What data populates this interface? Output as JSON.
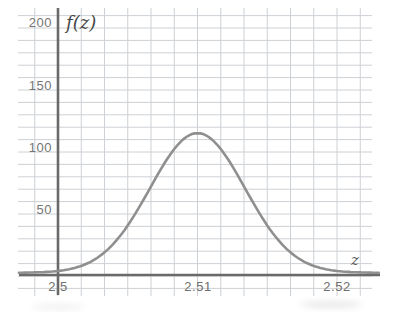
{
  "chart_data": {
    "type": "line",
    "title": "",
    "xlabel": "z",
    "ylabel": "f(z)",
    "x_ticks": [
      2.5,
      2.51,
      2.52
    ],
    "x_tick_labels": [
      "2.5",
      "2.51",
      "2.52"
    ],
    "y_ticks": [
      200,
      150,
      100,
      50
    ],
    "y_tick_labels": [
      "200",
      "150",
      "100",
      "50"
    ],
    "xlim": [
      2.4972,
      2.5231
    ],
    "ylim": [
      0,
      215
    ],
    "grid": true,
    "curve": {
      "kind": "gaussian",
      "center": 2.51,
      "sigma": 0.0034,
      "peak": 112
    },
    "points": [
      [
        2.5,
        1.5
      ],
      [
        2.501,
        3.4
      ],
      [
        2.502,
        7.0
      ],
      [
        2.503,
        13.5
      ],
      [
        2.504,
        23.6
      ],
      [
        2.505,
        38.0
      ],
      [
        2.506,
        56.0
      ],
      [
        2.507,
        75.9
      ],
      [
        2.508,
        94.2
      ],
      [
        2.509,
        107.3
      ],
      [
        2.51,
        112.0
      ],
      [
        2.511,
        107.3
      ],
      [
        2.512,
        94.2
      ],
      [
        2.513,
        75.9
      ],
      [
        2.514,
        56.0
      ],
      [
        2.515,
        38.0
      ],
      [
        2.516,
        23.6
      ],
      [
        2.517,
        13.5
      ],
      [
        2.518,
        7.0
      ],
      [
        2.519,
        3.4
      ],
      [
        2.52,
        1.5
      ]
    ]
  },
  "colors": {
    "background": "#ffffff",
    "grid": "#cdd0d4",
    "axis": "#6a6a6a",
    "curve": "#8f8f8f",
    "tick_text": "#757575",
    "axis_label_text": "#474747"
  }
}
